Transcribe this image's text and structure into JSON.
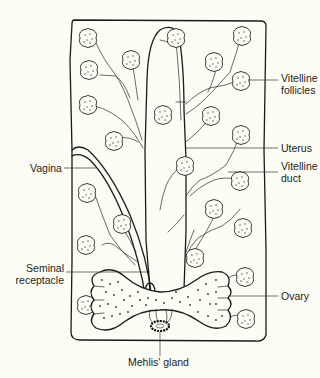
{
  "diagram": {
    "colors": {
      "background": "#fdfdf6",
      "line": "#1a1a1a",
      "label_text": "#222222"
    },
    "labels": {
      "vitelline_follicles_line1": "Vitelline",
      "vitelline_follicles_line2": "follicles",
      "uterus": "Uterus",
      "vitelline_duct_line1": "Vitelline",
      "vitelline_duct_line2": "duct",
      "vagina": "Vagina",
      "seminal_receptacle_line1": "Seminal",
      "seminal_receptacle_line2": "receptacle",
      "ovary": "Ovary",
      "mehlis_gland": "Mehlis' gland"
    },
    "structures": [
      "body-outline",
      "uterus",
      "vagina",
      "vitelline-follicles",
      "vitelline-ducts",
      "seminal-receptacle",
      "ovary",
      "mehlis-gland"
    ]
  }
}
